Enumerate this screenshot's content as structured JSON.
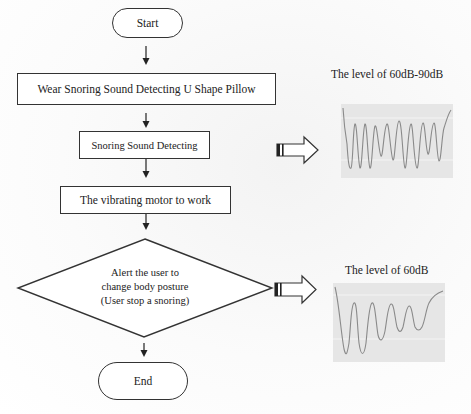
{
  "flowchart": {
    "start": "Start",
    "step1": "Wear Snoring Sound Detecting U Shape Pillow",
    "step2": "Snoring Sound Detecting",
    "step3": "The vibrating motor to work",
    "decision": {
      "line1": "Alert the user to",
      "line2": "change body posture",
      "line3": "(User stop a snoring)"
    },
    "end": "End"
  },
  "panels": {
    "top": {
      "title": "The level of 60dB-90dB",
      "arrow_icon": "block-right-arrow"
    },
    "bottom": {
      "title": "The level of 60dB",
      "arrow_icon": "block-right-arrow"
    }
  },
  "colors": {
    "stroke": "#333333",
    "chart_bg": "#e6e6e6",
    "waveform": "#8a8a8a"
  }
}
